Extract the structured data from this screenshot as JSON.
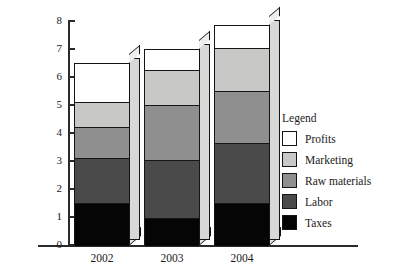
{
  "chart_data": {
    "type": "bar",
    "subtype": "stacked-bar-3d",
    "title": "",
    "xlabel": "",
    "ylabel": "Amount (millions of dollars)",
    "categories": [
      "2002",
      "2003",
      "2004"
    ],
    "ylim": [
      0,
      8
    ],
    "ytick_labels": [
      "0",
      "1",
      "2",
      "3",
      "4",
      "5",
      "6",
      "7",
      "8"
    ],
    "ytick_values": [
      0,
      1,
      2,
      3,
      4,
      5,
      6,
      7,
      8
    ],
    "grid": false,
    "legend_position": "right",
    "legend_title": "Legend",
    "stack_order_bottom_to_top": [
      "Taxes",
      "Labor",
      "Raw materials",
      "Marketing",
      "Profits"
    ],
    "series": [
      {
        "name": "Taxes",
        "color": "#050505",
        "values": [
          1.5,
          0.95,
          1.5
        ]
      },
      {
        "name": "Labor",
        "color": "#4a4a4a",
        "values": [
          1.6,
          2.1,
          2.15
        ]
      },
      {
        "name": "Raw materials",
        "color": "#8f8f8f",
        "values": [
          1.1,
          1.95,
          1.85
        ]
      },
      {
        "name": "Marketing",
        "color": "#c8c8c6",
        "values": [
          0.9,
          1.25,
          1.55
        ]
      },
      {
        "name": "Profits",
        "color": "#ffffff",
        "values": [
          1.4,
          0.75,
          0.8
        ]
      }
    ],
    "totals": [
      6.5,
      7.0,
      7.85
    ],
    "cumulative_tops": {
      "2002": [
        1.5,
        3.1,
        4.2,
        5.1,
        6.5
      ],
      "2003": [
        0.95,
        3.05,
        5.0,
        6.25,
        7.0
      ],
      "2004": [
        1.5,
        3.65,
        5.5,
        7.05,
        7.85
      ]
    }
  },
  "axis": {
    "y_title": "Amount (millions of dollars)",
    "y_ticks": [
      {
        "label": "8",
        "value": 8
      },
      {
        "label": "7",
        "value": 7
      },
      {
        "label": "6",
        "value": 6
      },
      {
        "label": "5",
        "value": 5
      },
      {
        "label": "4",
        "value": 4
      },
      {
        "label": "3",
        "value": 3
      },
      {
        "label": "2",
        "value": 2
      },
      {
        "label": "1",
        "value": 1
      },
      {
        "label": "0",
        "value": 0
      }
    ],
    "x_ticks": [
      {
        "label": "2002"
      },
      {
        "label": "2003"
      },
      {
        "label": "2004"
      }
    ]
  },
  "legend": {
    "title": "Legend",
    "items": [
      {
        "label": "Profits",
        "color": "#ffffff"
      },
      {
        "label": "Marketing",
        "color": "#c8c8c6"
      },
      {
        "label": "Raw materials",
        "color": "#8f8f8f"
      },
      {
        "label": "Labor",
        "color": "#4a4a4a"
      },
      {
        "label": "Taxes",
        "color": "#050505"
      }
    ]
  }
}
